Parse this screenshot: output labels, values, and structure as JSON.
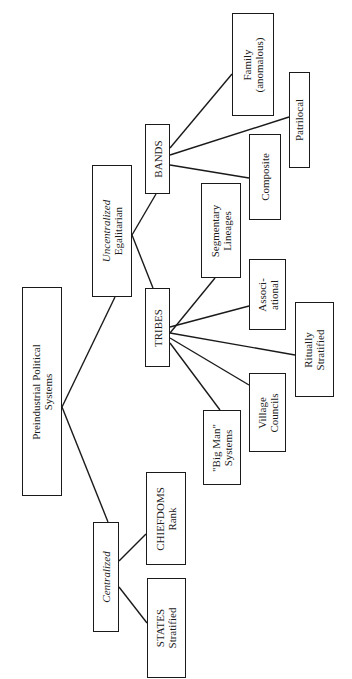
{
  "diagram": {
    "title": "Preindustrial Political Systems",
    "orientation": "rotated -90 degrees (tree grows left to right)",
    "nodes": {
      "root": {
        "line1": "Preindustrial Political",
        "line2": "Systems"
      },
      "uncentralized": {
        "line1": "Uncentralized",
        "line2": "Egalitarian"
      },
      "centralized": {
        "line1": "Centralized"
      },
      "bands": {
        "line1": "BANDS"
      },
      "tribes": {
        "line1": "TRIBES"
      },
      "chiefdoms": {
        "line1": "CHIEFDOMS",
        "line2": "Rank"
      },
      "states": {
        "line1": "STATES",
        "line2": "Stratified"
      },
      "family": {
        "line1": "Family",
        "line2": "(anomalous)"
      },
      "patrilocal": {
        "line1": "Patrilocal"
      },
      "composite": {
        "line1": "Composite"
      },
      "segmentary": {
        "line1": "Segmentary",
        "line2": "Lineages"
      },
      "associational": {
        "line1": "Associ-",
        "line2": "ational"
      },
      "ritually": {
        "line1": "Ritually",
        "line2": "Stratified"
      },
      "village": {
        "line1": "Village",
        "line2": "Councils"
      },
      "bigman": {
        "line1": "\"Big Man\"",
        "line2": "Systems"
      }
    },
    "edges": [
      [
        "root",
        "uncentralized"
      ],
      [
        "root",
        "centralized"
      ],
      [
        "uncentralized",
        "bands"
      ],
      [
        "uncentralized",
        "tribes"
      ],
      [
        "centralized",
        "chiefdoms"
      ],
      [
        "centralized",
        "states"
      ],
      [
        "bands",
        "family"
      ],
      [
        "bands",
        "patrilocal"
      ],
      [
        "bands",
        "composite"
      ],
      [
        "tribes",
        "segmentary"
      ],
      [
        "tribes",
        "associational"
      ],
      [
        "tribes",
        "ritually"
      ],
      [
        "tribes",
        "village"
      ],
      [
        "tribes",
        "bigman"
      ]
    ],
    "colors": {
      "stroke": "#1a1a1a",
      "background": "#ffffff"
    }
  }
}
